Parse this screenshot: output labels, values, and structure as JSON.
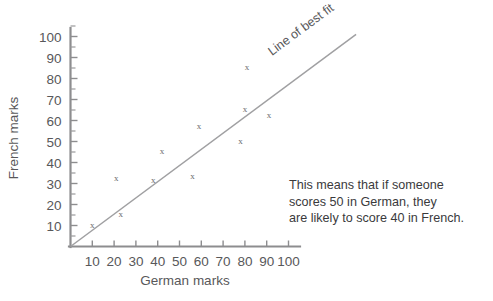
{
  "chart_data": {
    "type": "scatter",
    "title": "",
    "xlabel": "German marks",
    "ylabel": "French marks",
    "xlim": [
      0,
      105
    ],
    "ylim": [
      0,
      105
    ],
    "xticks": [
      10,
      20,
      30,
      40,
      50,
      60,
      70,
      80,
      90,
      100
    ],
    "yticks": [
      10,
      20,
      30,
      40,
      50,
      60,
      70,
      80,
      90,
      100
    ],
    "grid": false,
    "legend_position": "none",
    "marker_symbol": "x",
    "marker_color": "#6b6b6d",
    "axis_color": "#8d8d8f",
    "points": [
      {
        "x": 10,
        "y": 10
      },
      {
        "x": 23,
        "y": 15
      },
      {
        "x": 21,
        "y": 32
      },
      {
        "x": 38,
        "y": 31
      },
      {
        "x": 56,
        "y": 33
      },
      {
        "x": 42,
        "y": 45
      },
      {
        "x": 59,
        "y": 57
      },
      {
        "x": 78,
        "y": 50
      },
      {
        "x": 80,
        "y": 65
      },
      {
        "x": 91,
        "y": 62
      },
      {
        "x": 81,
        "y": 85
      }
    ],
    "series": [
      {
        "name": "German vs French marks",
        "x": [
          10,
          23,
          21,
          38,
          56,
          42,
          59,
          78,
          80,
          91,
          81
        ],
        "values": [
          10,
          15,
          32,
          31,
          33,
          45,
          57,
          50,
          65,
          62,
          85
        ]
      }
    ],
    "best_fit_line": {
      "label": "Line of best fit",
      "color": "#a0a0a2",
      "from": {
        "x": 0,
        "y": 0
      },
      "to": {
        "x": 131,
        "y": 101
      },
      "slope": 0.8,
      "intercept": 0
    },
    "annotations": [
      {
        "name": "interpretation-note",
        "text": "This means that if someone\nscores 50 in German, they\nare likely to score 40 in French."
      }
    ]
  },
  "axis": {
    "x_title": "German marks",
    "y_title": "French marks",
    "x_ticks": [
      "10",
      "20",
      "30",
      "40",
      "50",
      "60",
      "70",
      "80",
      "90",
      "100"
    ],
    "y_ticks": [
      "10",
      "20",
      "30",
      "40",
      "50",
      "60",
      "70",
      "80",
      "90",
      "100"
    ]
  },
  "labels": {
    "best_fit": "Line of best fit",
    "marker": "x"
  },
  "annotation": {
    "text": "This means that if someone\nscores 50 in German, they\nare likely to score 40 in French."
  }
}
